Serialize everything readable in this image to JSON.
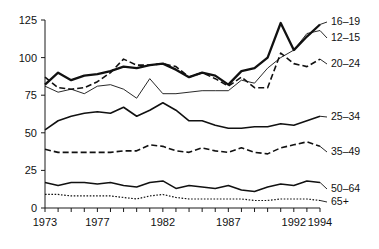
{
  "chart_data": {
    "type": "line",
    "title": "",
    "xlabel": "",
    "ylabel": "",
    "xlim": [
      1973,
      1994
    ],
    "ylim": [
      0,
      125
    ],
    "grid": false,
    "legend_position": "right-inline",
    "yticks": [
      0,
      25,
      50,
      75,
      100,
      125
    ],
    "ytick_labels": [
      "0",
      "25",
      "50",
      "75",
      "100",
      "125"
    ],
    "x": [
      1973,
      1974,
      1975,
      1976,
      1977,
      1978,
      1979,
      1980,
      1981,
      1982,
      1983,
      1984,
      1985,
      1986,
      1987,
      1988,
      1989,
      1990,
      1991,
      1992,
      1993,
      1994
    ],
    "xtick_labels_shown": [
      "1973",
      "1977",
      "1982",
      "1987",
      "1992",
      "1994"
    ],
    "xtick_label_years": [
      1973,
      1977,
      1982,
      1987,
      1992,
      1994
    ],
    "series": [
      {
        "name": "16-19",
        "label": "16–19",
        "style": "thick-solid",
        "values": [
          82,
          90,
          85,
          88,
          89,
          91,
          94,
          93,
          95,
          96,
          92,
          87,
          90,
          88,
          82,
          91,
          93,
          100,
          123,
          105,
          114,
          122
        ]
      },
      {
        "name": "12-15",
        "label": "12–15",
        "style": "thin-solid",
        "values": [
          81,
          77,
          79,
          76,
          81,
          82,
          79,
          73,
          86,
          76,
          76,
          77,
          78,
          78,
          78,
          85,
          83,
          93,
          100,
          105,
          116,
          118
        ]
      },
      {
        "name": "20-24",
        "label": "20–24",
        "style": "dashed",
        "values": [
          87,
          80,
          79,
          80,
          84,
          90,
          99,
          95,
          95,
          96,
          94,
          87,
          90,
          86,
          81,
          87,
          80,
          80,
          103,
          96,
          94,
          99
        ]
      },
      {
        "name": "25-34",
        "label": "25–34",
        "style": "medium-solid",
        "values": [
          52,
          58,
          61,
          63,
          64,
          63,
          67,
          61,
          65,
          70,
          65,
          58,
          58,
          55,
          53,
          53,
          54,
          54,
          56,
          55,
          58,
          61
        ]
      },
      {
        "name": "35-49",
        "label": "35–49",
        "style": "dashed",
        "values": [
          39,
          37,
          37,
          37,
          37,
          37,
          38,
          38,
          42,
          41,
          38,
          37,
          40,
          38,
          37,
          40,
          37,
          36,
          40,
          42,
          44,
          41
        ]
      },
      {
        "name": "50-64",
        "label": "50–64",
        "style": "solid",
        "values": [
          17,
          15,
          17,
          17,
          16,
          17,
          15,
          14,
          17,
          18,
          13,
          15,
          14,
          13,
          15,
          12,
          11,
          14,
          16,
          15,
          18,
          17
        ]
      },
      {
        "name": "65+",
        "label": "65+",
        "style": "dotted",
        "values": [
          9,
          9,
          8,
          8,
          8,
          8,
          7,
          6,
          8,
          9,
          7,
          6,
          6,
          6,
          6,
          6,
          5,
          5,
          6,
          6,
          6,
          5
        ]
      }
    ]
  }
}
